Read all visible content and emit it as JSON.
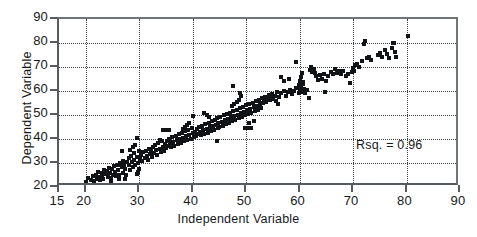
{
  "chart": {
    "type": "scatter",
    "title": "",
    "xlabel": "Independent Variable",
    "ylabel": "Dependent Variable",
    "annotation": "Rsq. = 0.96",
    "marker_color": "#111417",
    "axis_color": "#555b5e",
    "grid_color": "#3a3f42"
  },
  "chart_data": {
    "type": "scatter",
    "title": "",
    "xlabel": "Independent Variable",
    "ylabel": "Dependent Variable",
    "xlim": [
      15,
      90
    ],
    "ylim": [
      20,
      90
    ],
    "xticks": [
      15,
      20,
      30,
      40,
      50,
      60,
      70,
      80,
      90
    ],
    "yticks": [
      20,
      30,
      40,
      50,
      60,
      70,
      80,
      90
    ],
    "grid": "dotted-both-axes",
    "legend": "none",
    "annotations": [
      {
        "text": "Rsq. = 0.96",
        "x": 66.5,
        "y": 31.5
      }
    ],
    "series": [
      {
        "name": "observations",
        "marker": "square",
        "color": "#111417",
        "points": [
          [
            20.0,
            21.0
          ],
          [
            20.1,
            22.2
          ],
          [
            20.4,
            23.6
          ],
          [
            21.0,
            23.0
          ],
          [
            21.3,
            24.4
          ],
          [
            21.6,
            22.6
          ],
          [
            22.0,
            25.2
          ],
          [
            22.1,
            23.4
          ],
          [
            22.3,
            26.3
          ],
          [
            22.5,
            24.2
          ],
          [
            22.7,
            22.9
          ],
          [
            23.0,
            26.0
          ],
          [
            23.1,
            24.6
          ],
          [
            23.3,
            23.3
          ],
          [
            23.5,
            27.1
          ],
          [
            23.7,
            25.4
          ],
          [
            24.0,
            26.8
          ],
          [
            24.1,
            24.0
          ],
          [
            24.3,
            28.0
          ],
          [
            24.5,
            25.8
          ],
          [
            24.7,
            23.8
          ],
          [
            25.0,
            27.4
          ],
          [
            25.1,
            25.0
          ],
          [
            25.3,
            28.6
          ],
          [
            25.5,
            26.4
          ],
          [
            25.7,
            24.4
          ],
          [
            26.0,
            29.0
          ],
          [
            26.1,
            27.0
          ],
          [
            26.3,
            25.2
          ],
          [
            26.5,
            30.0
          ],
          [
            26.7,
            28.2
          ],
          [
            26.9,
            26.0
          ],
          [
            27.0,
            31.0
          ],
          [
            27.2,
            29.3
          ],
          [
            27.4,
            27.4
          ],
          [
            27.6,
            25.0
          ],
          [
            27.8,
            30.4
          ],
          [
            28.0,
            32.2
          ],
          [
            28.1,
            29.0
          ],
          [
            28.3,
            27.0
          ],
          [
            28.5,
            33.0
          ],
          [
            28.7,
            30.6
          ],
          [
            28.9,
            28.4
          ],
          [
            29.0,
            34.0
          ],
          [
            29.1,
            31.4
          ],
          [
            29.3,
            29.2
          ],
          [
            29.5,
            32.6
          ],
          [
            29.7,
            30.0
          ],
          [
            29.9,
            27.6
          ],
          [
            30.0,
            35.0
          ],
          [
            28.3,
            35.6
          ],
          [
            28.9,
            36.6
          ],
          [
            29.3,
            37.4
          ],
          [
            29.6,
            40.3
          ],
          [
            26.8,
            35.0
          ],
          [
            29.5,
            25.6
          ],
          [
            29.8,
            26.2
          ],
          [
            27.4,
            23.4
          ],
          [
            26.2,
            23.2
          ],
          [
            24.8,
            22.4
          ],
          [
            30.2,
            31.6
          ],
          [
            30.4,
            33.2
          ],
          [
            30.6,
            30.8
          ],
          [
            30.8,
            34.4
          ],
          [
            31.0,
            32.0
          ],
          [
            31.2,
            35.2
          ],
          [
            31.4,
            33.0
          ],
          [
            31.6,
            31.2
          ],
          [
            31.8,
            36.0
          ],
          [
            32.0,
            33.6
          ],
          [
            32.2,
            35.0
          ],
          [
            32.4,
            32.4
          ],
          [
            32.6,
            36.8
          ],
          [
            32.8,
            34.2
          ],
          [
            33.0,
            37.6
          ],
          [
            33.2,
            35.4
          ],
          [
            33.4,
            33.2
          ],
          [
            33.6,
            38.4
          ],
          [
            33.8,
            36.0
          ],
          [
            34.0,
            34.6
          ],
          [
            34.2,
            39.0
          ],
          [
            34.4,
            36.8
          ],
          [
            34.6,
            35.0
          ],
          [
            34.8,
            38.0
          ],
          [
            35.0,
            36.4
          ],
          [
            34.4,
            43.6
          ],
          [
            35.0,
            43.6
          ],
          [
            35.6,
            43.6
          ],
          [
            33.8,
            39.6
          ],
          [
            35.2,
            39.2
          ],
          [
            35.4,
            37.0
          ],
          [
            35.6,
            40.0
          ],
          [
            35.8,
            38.2
          ],
          [
            36.0,
            36.6
          ],
          [
            36.2,
            40.8
          ],
          [
            36.4,
            38.8
          ],
          [
            36.6,
            37.2
          ],
          [
            36.8,
            41.4
          ],
          [
            37.0,
            39.4
          ],
          [
            37.2,
            37.8
          ],
          [
            37.4,
            42.0
          ],
          [
            37.6,
            40.0
          ],
          [
            37.8,
            38.4
          ],
          [
            38.0,
            42.6
          ],
          [
            38.2,
            40.6
          ],
          [
            38.4,
            39.0
          ],
          [
            38.6,
            43.2
          ],
          [
            38.8,
            41.2
          ],
          [
            39.0,
            39.6
          ],
          [
            39.2,
            43.8
          ],
          [
            39.4,
            41.8
          ],
          [
            39.6,
            40.2
          ],
          [
            39.8,
            44.4
          ],
          [
            40.0,
            42.4
          ],
          [
            40.2,
            40.8
          ],
          [
            38.6,
            45.0
          ],
          [
            39.0,
            45.8
          ],
          [
            39.4,
            46.6
          ],
          [
            38.2,
            44.0
          ],
          [
            40.0,
            49.6
          ],
          [
            40.4,
            43.0
          ],
          [
            40.6,
            41.4
          ],
          [
            40.8,
            44.2
          ],
          [
            41.0,
            42.0
          ],
          [
            41.2,
            45.0
          ],
          [
            41.4,
            43.0
          ],
          [
            41.6,
            41.6
          ],
          [
            41.8,
            45.6
          ],
          [
            42.0,
            43.6
          ],
          [
            42.2,
            42.0
          ],
          [
            42.4,
            46.2
          ],
          [
            42.6,
            44.2
          ],
          [
            42.8,
            42.6
          ],
          [
            43.0,
            46.8
          ],
          [
            43.2,
            44.8
          ],
          [
            43.4,
            43.2
          ],
          [
            43.6,
            47.4
          ],
          [
            43.8,
            45.4
          ],
          [
            44.0,
            43.8
          ],
          [
            44.2,
            48.0
          ],
          [
            42.2,
            51.0
          ],
          [
            42.6,
            50.0
          ],
          [
            43.0,
            49.2
          ],
          [
            44.6,
            39.0
          ],
          [
            44.8,
            44.6
          ],
          [
            44.4,
            46.0
          ],
          [
            44.6,
            48.6
          ],
          [
            44.8,
            46.6
          ],
          [
            45.0,
            45.0
          ],
          [
            45.2,
            49.2
          ],
          [
            45.4,
            47.2
          ],
          [
            45.6,
            45.6
          ],
          [
            45.8,
            49.8
          ],
          [
            46.0,
            47.8
          ],
          [
            46.2,
            46.2
          ],
          [
            46.4,
            50.4
          ],
          [
            46.6,
            48.4
          ],
          [
            46.8,
            46.8
          ],
          [
            47.0,
            51.0
          ],
          [
            47.2,
            49.0
          ],
          [
            47.4,
            47.4
          ],
          [
            47.6,
            51.6
          ],
          [
            47.8,
            49.6
          ],
          [
            48.0,
            48.0
          ],
          [
            48.2,
            52.2
          ],
          [
            48.4,
            50.2
          ],
          [
            48.6,
            48.6
          ],
          [
            48.8,
            52.8
          ],
          [
            49.0,
            50.8
          ],
          [
            49.2,
            49.2
          ],
          [
            47.4,
            53.6
          ],
          [
            47.8,
            54.6
          ],
          [
            48.2,
            55.6
          ],
          [
            48.6,
            56.2
          ],
          [
            47.6,
            62.2
          ],
          [
            48.8,
            59.0
          ],
          [
            49.0,
            58.0
          ],
          [
            49.4,
            53.4
          ],
          [
            49.6,
            51.4
          ],
          [
            49.8,
            49.8
          ],
          [
            50.0,
            54.0
          ],
          [
            50.2,
            52.0
          ],
          [
            50.4,
            50.4
          ],
          [
            50.6,
            54.6
          ],
          [
            50.8,
            52.6
          ],
          [
            51.0,
            51.0
          ],
          [
            51.2,
            55.2
          ],
          [
            51.4,
            53.2
          ],
          [
            51.6,
            51.6
          ],
          [
            51.8,
            55.8
          ],
          [
            52.0,
            53.8
          ],
          [
            52.2,
            52.2
          ],
          [
            52.4,
            56.4
          ],
          [
            52.6,
            54.4
          ],
          [
            52.8,
            52.8
          ],
          [
            49.8,
            44.4
          ],
          [
            50.4,
            44.4
          ],
          [
            51.0,
            44.4
          ],
          [
            50.6,
            46.6
          ],
          [
            51.4,
            47.6
          ],
          [
            53.0,
            57.0
          ],
          [
            53.2,
            55.0
          ],
          [
            53.4,
            56.0
          ],
          [
            53.6,
            57.6
          ],
          [
            53.8,
            55.6
          ],
          [
            54.0,
            56.6
          ],
          [
            54.2,
            58.2
          ],
          [
            54.4,
            56.2
          ],
          [
            54.6,
            57.2
          ],
          [
            54.8,
            58.8
          ],
          [
            55.0,
            56.8
          ],
          [
            55.4,
            57.8
          ],
          [
            55.8,
            59.4
          ],
          [
            56.2,
            57.4
          ],
          [
            56.6,
            59.0
          ],
          [
            55.6,
            55.8
          ],
          [
            56.0,
            54.6
          ],
          [
            57.0,
            60.0
          ],
          [
            57.4,
            58.0
          ],
          [
            57.8,
            59.6
          ],
          [
            58.2,
            60.6
          ],
          [
            58.6,
            58.6
          ],
          [
            59.0,
            60.2
          ],
          [
            59.4,
            61.2
          ],
          [
            59.8,
            59.2
          ],
          [
            56.6,
            66.0
          ],
          [
            57.0,
            64.2
          ],
          [
            58.0,
            65.0
          ],
          [
            59.4,
            72.0
          ],
          [
            59.8,
            62.4
          ],
          [
            60.0,
            60.8
          ],
          [
            60.2,
            62.0
          ],
          [
            60.4,
            59.4
          ],
          [
            60.6,
            63.0
          ],
          [
            60.8,
            61.0
          ],
          [
            60.0,
            64.2
          ],
          [
            60.2,
            66.0
          ],
          [
            60.4,
            67.4
          ],
          [
            60.6,
            63.8
          ],
          [
            61.0,
            59.0
          ],
          [
            61.4,
            60.4
          ],
          [
            61.8,
            57.2
          ],
          [
            62.0,
            68.8
          ],
          [
            62.2,
            70.0
          ],
          [
            62.4,
            68.0
          ],
          [
            62.6,
            69.2
          ],
          [
            62.8,
            67.4
          ],
          [
            63.0,
            66.2
          ],
          [
            63.4,
            64.6
          ],
          [
            63.8,
            66.8
          ],
          [
            64.2,
            65.2
          ],
          [
            64.6,
            67.0
          ],
          [
            65.0,
            64.2
          ],
          [
            65.4,
            66.4
          ],
          [
            65.8,
            68.0
          ],
          [
            64.8,
            59.6
          ],
          [
            66.2,
            67.2
          ],
          [
            66.6,
            69.0
          ],
          [
            67.0,
            67.6
          ],
          [
            67.4,
            68.4
          ],
          [
            67.8,
            67.0
          ],
          [
            68.2,
            68.2
          ],
          [
            68.6,
            66.4
          ],
          [
            69.0,
            67.2
          ],
          [
            69.4,
            63.4
          ],
          [
            69.8,
            68.0
          ],
          [
            70.0,
            69.6
          ],
          [
            70.2,
            68.2
          ],
          [
            70.4,
            70.8
          ],
          [
            70.8,
            71.4
          ],
          [
            71.2,
            70.0
          ],
          [
            71.6,
            72.6
          ],
          [
            72.0,
            79.6
          ],
          [
            72.2,
            81.0
          ],
          [
            72.6,
            73.6
          ],
          [
            73.0,
            74.2
          ],
          [
            73.4,
            72.8
          ],
          [
            74.6,
            75.0
          ],
          [
            75.0,
            76.0
          ],
          [
            75.4,
            74.2
          ],
          [
            76.0,
            77.0
          ],
          [
            76.4,
            75.4
          ],
          [
            76.8,
            73.8
          ],
          [
            77.2,
            78.0
          ],
          [
            77.4,
            80.0
          ],
          [
            77.6,
            79.8
          ],
          [
            77.8,
            76.4
          ],
          [
            78.0,
            74.0
          ],
          [
            80.2,
            83.0
          ]
        ]
      }
    ]
  },
  "ticks": {
    "x": [
      "15",
      "20",
      "30",
      "40",
      "50",
      "60",
      "70",
      "80",
      "90"
    ],
    "y": [
      "20",
      "30",
      "40",
      "50",
      "60",
      "70",
      "80",
      "90"
    ]
  }
}
